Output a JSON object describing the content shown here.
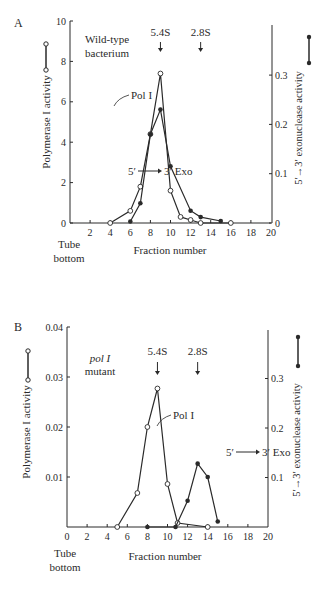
{
  "chart_data": [
    {
      "panel": "A",
      "type": "line",
      "title": "",
      "annotation": [
        "Wild-type",
        "bacterium"
      ],
      "xlabel": "Fraction number",
      "xlabel_left": [
        "Tube",
        "bottom"
      ],
      "ylabel": "Polymerase I activity",
      "ylabel_right": "5′→3′ exonuclease activity",
      "xlim": [
        0,
        20
      ],
      "ylim": [
        0,
        10
      ],
      "ylim_right": [
        0,
        0.35
      ],
      "x_ticks": [
        "2",
        "4",
        "6",
        "8",
        "10",
        "12",
        "14",
        "16",
        "18",
        "20"
      ],
      "y_ticks": [
        "0",
        "2",
        "4",
        "6",
        "8",
        "10"
      ],
      "y_ticks_right": [
        "0",
        "0.1",
        "0.2",
        "0.3"
      ],
      "markers": [
        {
          "label": "5.4S",
          "x": 9
        },
        {
          "label": "2.8S",
          "x": 13
        }
      ],
      "series": [
        {
          "name": "Pol I",
          "marker": "open-circle",
          "axis": "left",
          "x": [
            4,
            6,
            7,
            8,
            9,
            10,
            11,
            12,
            13,
            16
          ],
          "values": [
            0,
            0.6,
            1.8,
            4.4,
            7.4,
            1.6,
            0.3,
            0.15,
            0,
            0
          ]
        },
        {
          "name": "5′→3′ Exo",
          "marker": "filled-circle",
          "axis": "right",
          "x": [
            6,
            7,
            8,
            9,
            10,
            12,
            13,
            15
          ],
          "values": [
            0.003,
            0.04,
            0.18,
            0.23,
            0.115,
            0.025,
            0.012,
            0.004
          ]
        }
      ]
    },
    {
      "panel": "B",
      "type": "line",
      "title": "",
      "annotation": [
        "pol I",
        "mutant"
      ],
      "xlabel": "Fraction number",
      "xlabel_left": [
        "Tube",
        "bottom"
      ],
      "ylabel": "Polymerase I activity",
      "ylabel_right": "5′→3′ exonuclease activity",
      "xlim": [
        0,
        20
      ],
      "ylim": [
        0,
        0.04
      ],
      "ylim_right": [
        0,
        0.4
      ],
      "x_ticks": [
        "0",
        "2",
        "4",
        "6",
        "8",
        "10",
        "12",
        "14",
        "16",
        "18",
        "20"
      ],
      "y_ticks": [
        "0.01",
        "0.02",
        "0.03",
        "0.04"
      ],
      "y_ticks_right": [
        "0.1",
        "0.2",
        "0.3"
      ],
      "markers": [
        {
          "label": "5.4S",
          "x": 9
        },
        {
          "label": "2.8S",
          "x": 13
        }
      ],
      "series": [
        {
          "name": "Pol I",
          "marker": "open-circle",
          "axis": "left",
          "x": [
            5,
            7,
            8,
            9,
            10,
            11,
            14
          ],
          "values": [
            0,
            0.0068,
            0.02,
            0.0277,
            0.0086,
            0.0008,
            0
          ]
        },
        {
          "name": "5′→3′ Exo",
          "marker": "filled-circle",
          "axis": "right",
          "x": [
            8,
            10.8,
            12,
            13,
            14,
            15
          ],
          "values": [
            0,
            0,
            0.053,
            0.128,
            0.101,
            0.011
          ]
        }
      ]
    }
  ],
  "labels": {
    "panelA": "A",
    "panelB": "B",
    "wildtype1": "Wild-type",
    "wildtype2": "bacterium",
    "mutant1": "pol I",
    "mutant2": "mutant",
    "s54": "5.4S",
    "s28": "2.8S",
    "polI": "Pol I",
    "exo5": "5′",
    "exo3": "3′ Exo",
    "ylabel": "Polymerase I activity",
    "ylabel_right_pre": "5′",
    "ylabel_right_mid": "3′ exonuclease activity",
    "xlabel": "Fraction number",
    "tube": "Tube",
    "bottom": "bottom"
  }
}
